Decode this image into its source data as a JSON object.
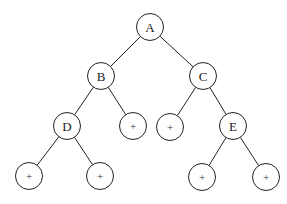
{
  "diagram": {
    "type": "binary-tree",
    "node_radius": 13.5,
    "stroke_color": "#222222",
    "nodes": [
      {
        "id": "A",
        "label": "A",
        "x": 150,
        "y": 27,
        "kind": "internal"
      },
      {
        "id": "B",
        "label": "B",
        "x": 101,
        "y": 76,
        "kind": "internal"
      },
      {
        "id": "C",
        "label": "C",
        "x": 203,
        "y": 76,
        "kind": "internal"
      },
      {
        "id": "D",
        "label": "D",
        "x": 67,
        "y": 126,
        "kind": "internal"
      },
      {
        "id": "B_r",
        "label": "+",
        "x": 133,
        "y": 126,
        "kind": "leaf"
      },
      {
        "id": "C_l",
        "label": "+",
        "x": 170,
        "y": 127,
        "kind": "leaf"
      },
      {
        "id": "E",
        "label": "E",
        "x": 233,
        "y": 126,
        "kind": "internal"
      },
      {
        "id": "D_l",
        "label": "+",
        "x": 29,
        "y": 176,
        "kind": "leaf"
      },
      {
        "id": "D_r",
        "label": "+",
        "x": 100,
        "y": 176,
        "kind": "leaf"
      },
      {
        "id": "E_l",
        "label": "+",
        "x": 202,
        "y": 177,
        "kind": "leaf"
      },
      {
        "id": "E_r",
        "label": "+",
        "x": 266,
        "y": 177,
        "kind": "leaf"
      }
    ],
    "edges": [
      [
        "A",
        "B"
      ],
      [
        "A",
        "C"
      ],
      [
        "B",
        "D"
      ],
      [
        "B",
        "B_r"
      ],
      [
        "C",
        "C_l"
      ],
      [
        "C",
        "E"
      ],
      [
        "D",
        "D_l"
      ],
      [
        "D",
        "D_r"
      ],
      [
        "E",
        "E_l"
      ],
      [
        "E",
        "E_r"
      ]
    ]
  }
}
